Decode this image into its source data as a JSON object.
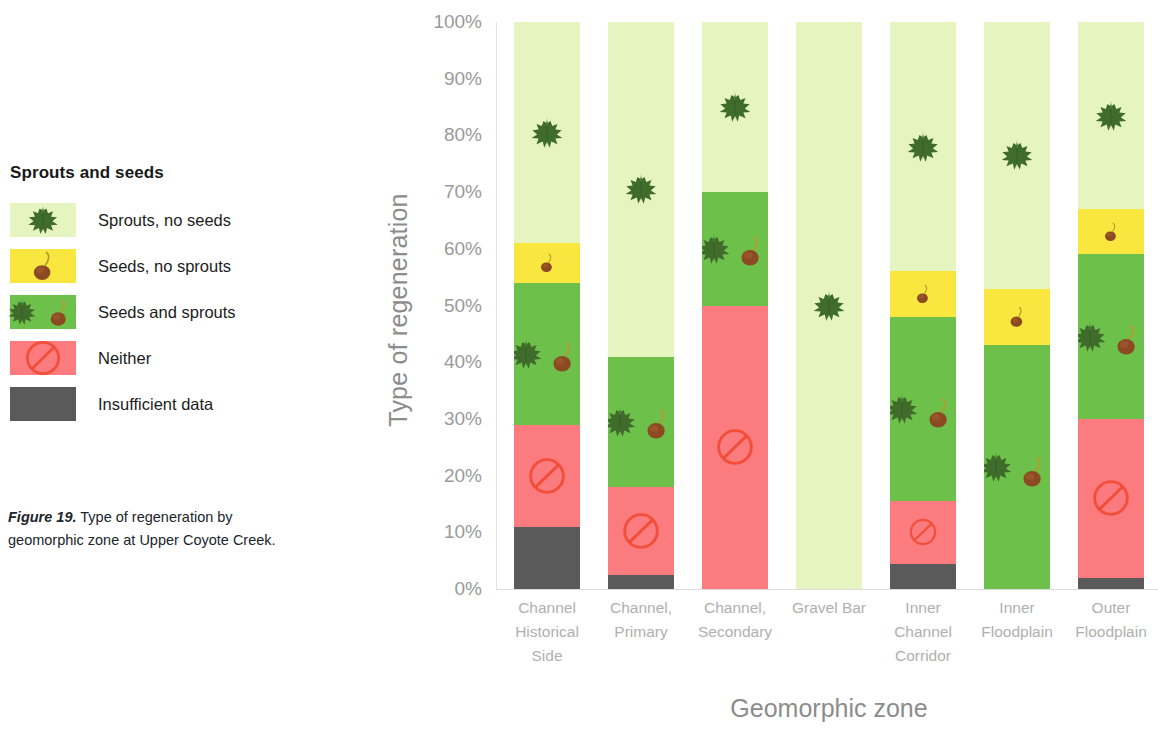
{
  "legend": {
    "title": "Sprouts and seeds",
    "items": [
      {
        "label": "Sprouts, no seeds",
        "color": "#e6f4c0",
        "icon": "leaf-icon",
        "key": "sprouts_no_seeds"
      },
      {
        "label": "Seeds, no sprouts",
        "color": "#f9e73f",
        "icon": "seed-icon",
        "key": "seeds_no_sprouts"
      },
      {
        "label": "Seeds and sprouts",
        "color": "#6dc04a",
        "icon": "leaf-and-seed-icon",
        "key": "seeds_and_sprouts"
      },
      {
        "label": "Neither",
        "color": "#fb7b7f",
        "icon": "prohibition-icon",
        "key": "neither"
      },
      {
        "label": "Insufficient data",
        "color": "#5a5a5a",
        "icon": "none",
        "key": "insufficient_data"
      }
    ]
  },
  "caption": {
    "figure_number": "Figure 19.",
    "text": " Type of regeneration by geomorphic zone at Upper Coyote Creek."
  },
  "chart_data": {
    "type": "bar",
    "stacked": true,
    "stack_mode": "percent",
    "title": "",
    "xlabel": "Geomorphic zone",
    "ylabel": "Type of regeneration",
    "ylim": [
      0,
      100
    ],
    "ytick_labels": [
      "100%",
      "90%",
      "80%",
      "70%",
      "60%",
      "50%",
      "40%",
      "30%",
      "20%",
      "10%",
      "0%"
    ],
    "ytick_values": [
      100,
      90,
      80,
      70,
      60,
      50,
      40,
      30,
      20,
      10,
      0
    ],
    "grid": false,
    "legend_position": "left-outside",
    "categories": [
      "Channel Historical Side",
      "Channel, Primary",
      "Channel, Secondary",
      "Gravel Bar",
      "Inner Channel Corridor",
      "Inner Floodplain",
      "Outer Floodplain"
    ],
    "category_lines": [
      [
        "Channel",
        "Historical",
        "Side"
      ],
      [
        "Channel,",
        "Primary"
      ],
      [
        "Channel,",
        "Secondary"
      ],
      [
        "Gravel Bar"
      ],
      [
        "Inner",
        "Channel",
        "Corridor"
      ],
      [
        "Inner",
        "Floodplain"
      ],
      [
        "Outer",
        "Floodplain"
      ]
    ],
    "series": [
      {
        "name": "Insufficient data",
        "color": "#5a5a5a",
        "icon": "none",
        "values": [
          11,
          2.5,
          0,
          0,
          4.5,
          0,
          2
        ]
      },
      {
        "name": "Neither",
        "color": "#fb7b7f",
        "icon": "prohibition-icon",
        "values": [
          18,
          15.5,
          50,
          0,
          11,
          0,
          28
        ]
      },
      {
        "name": "Seeds and sprouts",
        "color": "#6dc04a",
        "icon": "leaf-and-seed-icon",
        "values": [
          25,
          23,
          20,
          0,
          32.5,
          43,
          29
        ]
      },
      {
        "name": "Seeds, no sprouts",
        "color": "#f9e73f",
        "icon": "seed-icon",
        "values": [
          7,
          0,
          0,
          0,
          8,
          10,
          8
        ]
      },
      {
        "name": "Sprouts, no seeds",
        "color": "#e6f4c0",
        "icon": "leaf-icon",
        "values": [
          39,
          59,
          30,
          100,
          44,
          47,
          33
        ]
      }
    ]
  }
}
